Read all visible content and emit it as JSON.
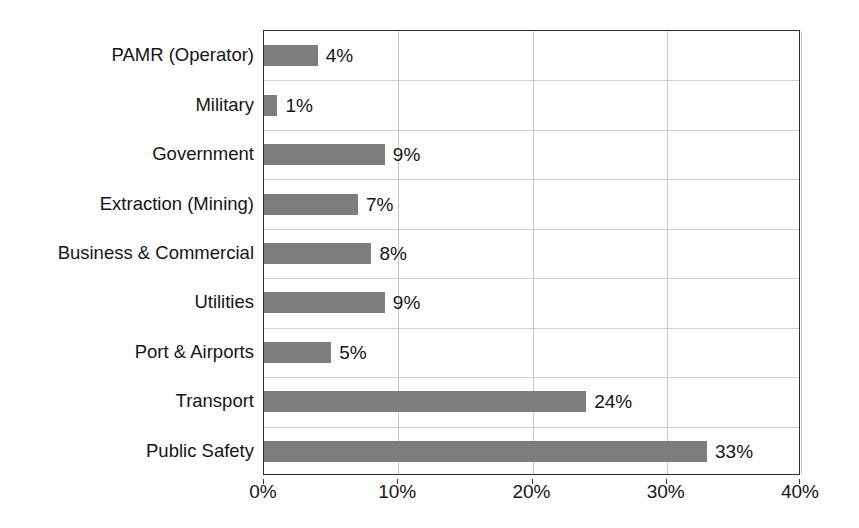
{
  "chart_data": {
    "type": "bar",
    "orientation": "horizontal",
    "title": "",
    "subtitle": "",
    "xlabel": "",
    "ylabel": "",
    "categories": [
      "PAMR (Operator)",
      "Military",
      "Government",
      "Extraction (Mining)",
      "Business & Commercial",
      "Utilities",
      "Port & Airports",
      "Transport",
      "Public Safety"
    ],
    "values": [
      4,
      1,
      9,
      7,
      8,
      9,
      5,
      24,
      33
    ],
    "data_labels": [
      "4%",
      "1%",
      "9%",
      "7%",
      "8%",
      "9%",
      "5%",
      "24%",
      "33%"
    ],
    "xlim": [
      0,
      40
    ],
    "x_ticks": [
      0,
      10,
      20,
      30,
      40
    ],
    "x_tick_labels": [
      "0%",
      "10%",
      "20%",
      "30%",
      "40%"
    ],
    "grid": {
      "vertical": true,
      "horizontal": true,
      "color": "#c8c8c8"
    },
    "legend": null,
    "bar_color": "#7d7d7d",
    "axis_color": "#2e2e2e",
    "background": "#ffffff"
  }
}
